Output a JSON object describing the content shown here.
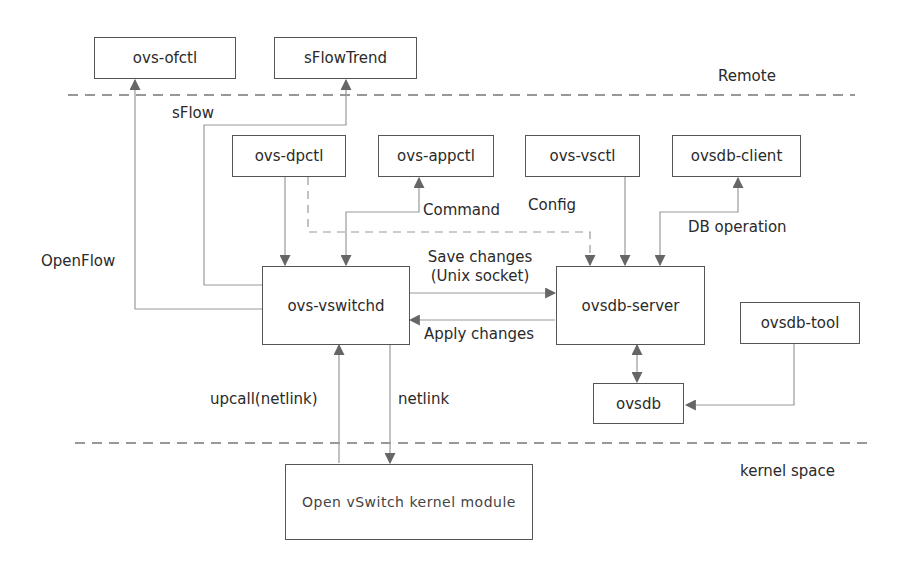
{
  "diagram": {
    "zones": {
      "remote_label": "Remote",
      "kernel_label": "kernel space"
    },
    "nodes": {
      "ovs_ofctl": "ovs-ofctl",
      "sflowtrend": "sFlowTrend",
      "ovs_dpctl": "ovs-dpctl",
      "ovs_appctl": "ovs-appctl",
      "ovs_vsctl": "ovs-vsctl",
      "ovsdb_client": "ovsdb-client",
      "ovs_vswitchd": "ovs-vswitchd",
      "ovsdb_server": "ovsdb-server",
      "ovsdb_tool": "ovsdb-tool",
      "ovsdb": "ovsdb",
      "kernel_module": "Open vSwitch kernel module"
    },
    "edge_labels": {
      "sflow": "sFlow",
      "openflow": "OpenFlow",
      "command": "Command",
      "config": "Config",
      "db_operation": "DB operation",
      "save_changes_line1": "Save changes",
      "save_changes_line2": "(Unix socket)",
      "apply_changes": "Apply changes",
      "upcall": "upcall(netlink)",
      "netlink": "netlink"
    },
    "colors": {
      "line": "#888888",
      "arrow": "#666666",
      "box_border": "#555555",
      "text": "#2a2a2a"
    }
  }
}
